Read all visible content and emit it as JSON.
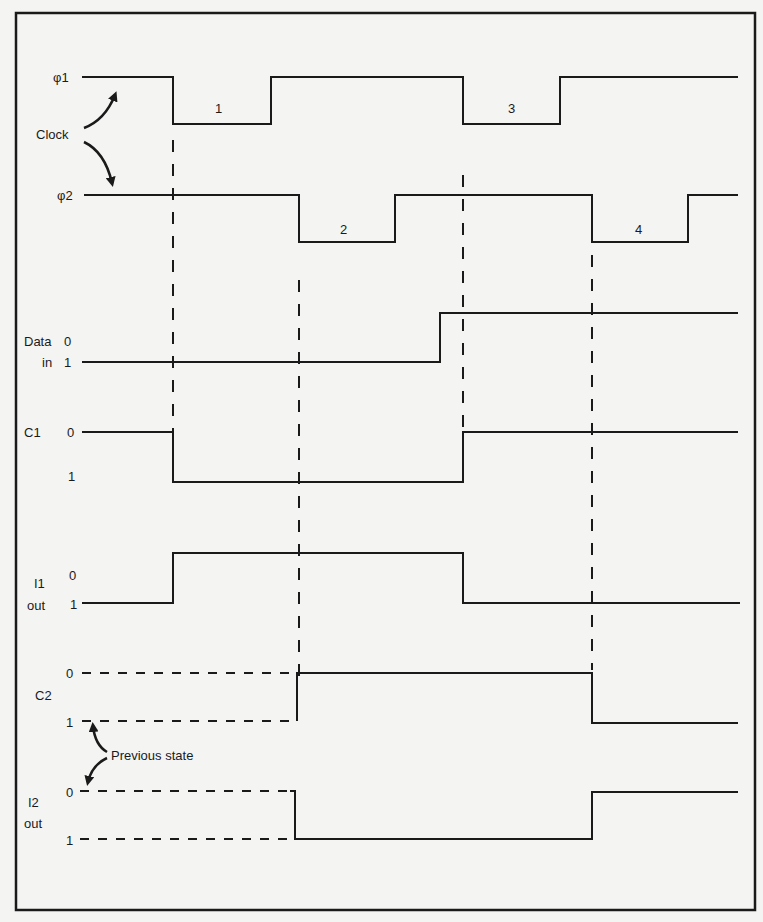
{
  "figure": {
    "type": "timing-diagram",
    "colors": {
      "background": "#f4f4f2",
      "ink": "#1a1a1a"
    }
  },
  "clock": {
    "label": "Clock",
    "phi1": {
      "label": "φ1",
      "pulse_label": [
        "1",
        "3"
      ]
    },
    "phi2": {
      "label": "φ2",
      "pulse_label": [
        "2",
        "4"
      ]
    }
  },
  "signals": {
    "data_in": {
      "label_line1": "Data",
      "label_line2": "in",
      "level0": "0",
      "level1": "1"
    },
    "c1": {
      "label": "C1",
      "level0": "0",
      "level1": "1"
    },
    "i1_out": {
      "label_line1": "I1",
      "label_line2": "out",
      "level0": "0",
      "level1": "1"
    },
    "c2": {
      "label": "C2",
      "level0": "0",
      "level1": "1"
    },
    "i2_out": {
      "label_line1": "I2",
      "label_line2": "out",
      "level0": "0",
      "level1": "1"
    }
  },
  "annotations": {
    "previous_state": "Previous state"
  }
}
